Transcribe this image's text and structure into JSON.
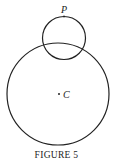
{
  "figure": {
    "caption": "FIGURE 5",
    "labels": {
      "point_p": "P",
      "center_c": "C"
    },
    "large_circle": {
      "cx": 58,
      "cy": 94,
      "r": 51
    },
    "small_circle": {
      "cx": 64,
      "cy": 38,
      "r": 21.5
    },
    "stroke_color": "#222222"
  }
}
